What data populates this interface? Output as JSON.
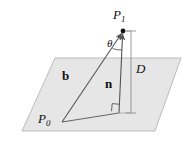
{
  "figure": {
    "background_color": "#ffffff",
    "stroke_color": "#555555",
    "plane_fill_color": "#e6e6e6",
    "plane_stroke_color": "#b0b0b0",
    "labels": {
      "point_p1": "P",
      "point_p1_sub": "1",
      "point_p0": "P",
      "point_p0_sub": "0",
      "angle_theta": "θ",
      "distance_d": "D",
      "vector_b": "b",
      "vector_n": "n"
    },
    "geometry": {
      "plane_polygon": "55,58 181,58 155,131 22,131",
      "p1": {
        "x": 123,
        "y": 31
      },
      "p0": {
        "x": 62,
        "y": 122
      },
      "foot": {
        "x": 119,
        "y": 113
      },
      "d_line_x": 131,
      "d_line_top_y": 31,
      "d_line_bottom_y": 113,
      "theta_arc_radius": 17,
      "right_angle_size": 8
    }
  }
}
